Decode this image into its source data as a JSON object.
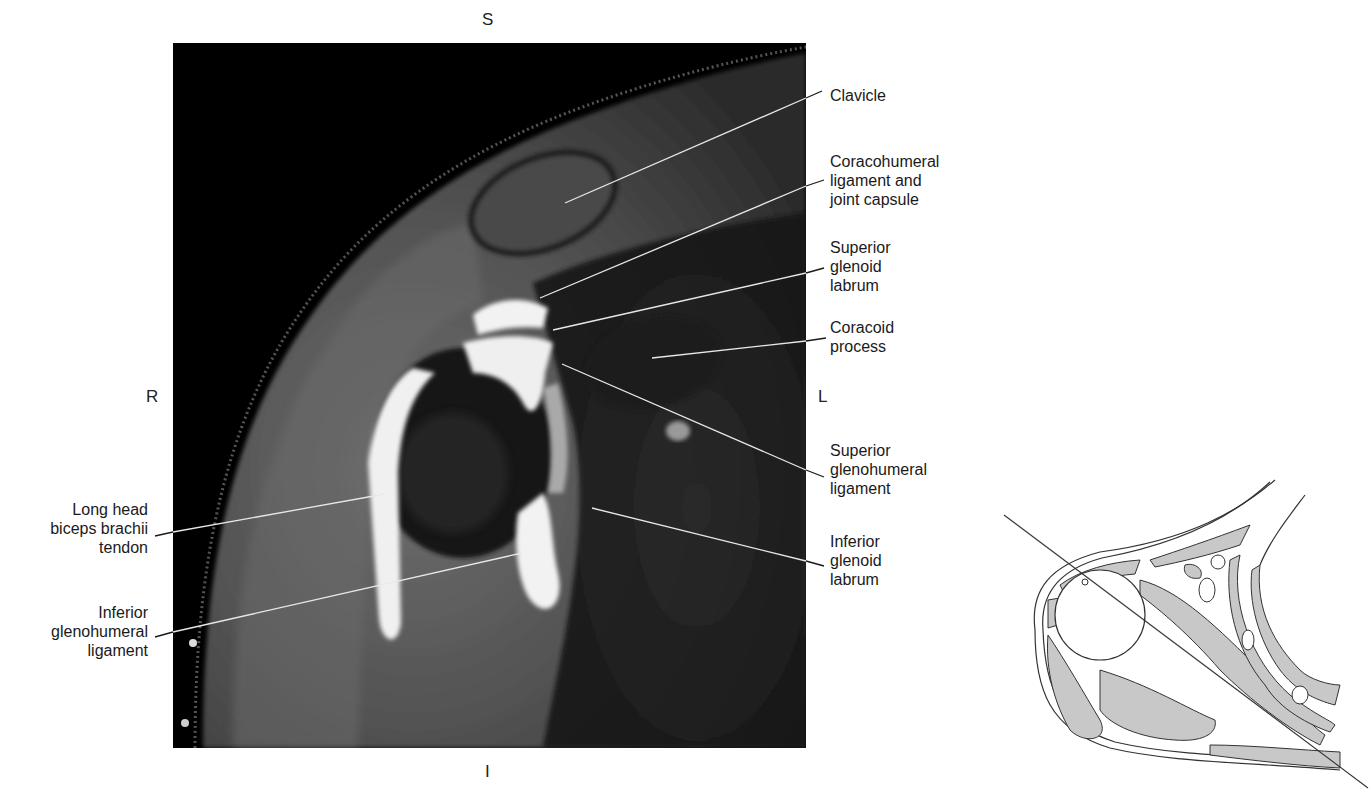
{
  "figure": {
    "type": "labeled coronal MRI of shoulder with orientation inset",
    "orientation": {
      "superior": "S",
      "inferior": "I",
      "right": "R",
      "left": "L"
    },
    "labels_right": [
      {
        "id": "clavicle",
        "text": "Clavicle"
      },
      {
        "id": "coracohumeral",
        "text": "Coracohumeral\nligament and\njoint capsule"
      },
      {
        "id": "superior-glenoid-labrum",
        "text": "Superior\nglenoid\nlabrum"
      },
      {
        "id": "coracoid",
        "text": "Coracoid\nprocess"
      },
      {
        "id": "superior-glenohumeral",
        "text": "Superior\nglenohumeral\nligament"
      },
      {
        "id": "inferior-glenoid-labrum",
        "text": "Inferior\nglenoid\nlabrum"
      }
    ],
    "labels_left": [
      {
        "id": "long-head-biceps",
        "text": "Long head\nbiceps brachii\ntendon"
      },
      {
        "id": "inferior-glenohumeral",
        "text": "Inferior\nglenohumeral\nligament"
      }
    ],
    "colors": {
      "mri_background": "#000000",
      "soft_tissue": "#5a5a5a",
      "fluid_bright": "#f2f2f2",
      "inset_fill": "#c8c8c8",
      "inset_stroke": "#333333",
      "leader_line": "#e8e8e8",
      "leader_line_outside": "#1a1a1a"
    }
  }
}
